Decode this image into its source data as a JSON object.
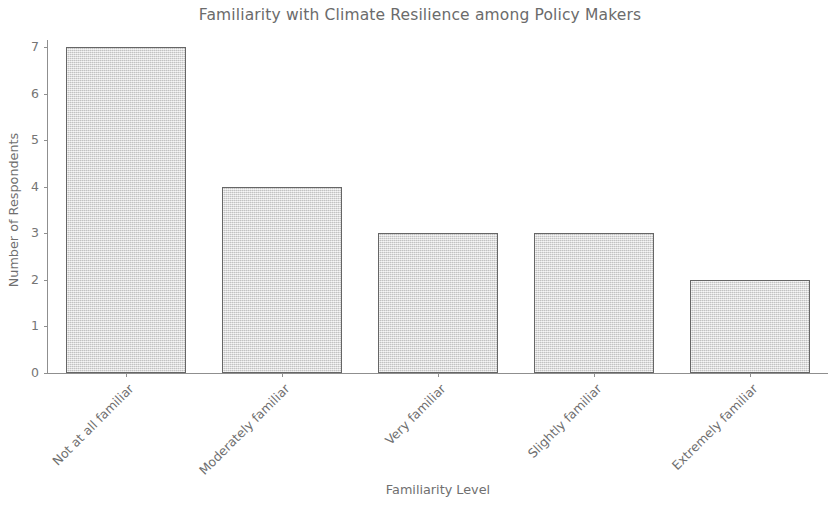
{
  "chart_data": {
    "type": "bar",
    "title": "Familiarity with Climate Resilience among Policy Makers",
    "xlabel": "Familiarity Level",
    "ylabel": "Number of Respondents",
    "categories": [
      "Not at all familiar",
      "Moderately familiar",
      "Very familiar",
      "Slightly familiar",
      "Extremely familiar"
    ],
    "values": [
      7,
      4,
      3,
      3,
      2
    ],
    "ylim": [
      0,
      7
    ],
    "yticks": [
      0,
      1,
      2,
      3,
      4,
      5,
      6,
      7
    ],
    "ytick_labels": [
      "0",
      "1",
      "2",
      "3",
      "4",
      "5",
      "6",
      "7"
    ],
    "grid": false,
    "legend": null,
    "bar_fill_color": "#d9d9d9",
    "bar_edge_color": "#666666",
    "axis_color": "#8f8f8f",
    "text_color": "#6f6f6f",
    "background_color": "#ffffff",
    "xtick_label_rotation": -45
  }
}
